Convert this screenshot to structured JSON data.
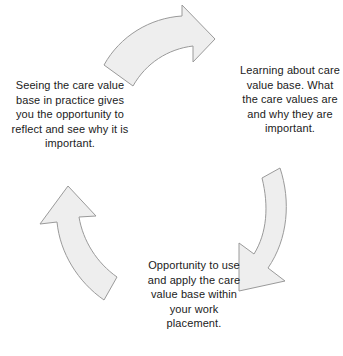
{
  "diagram": {
    "type": "cycle",
    "background_color": "#ffffff",
    "arrow_fill_color": "#eeeeee",
    "arrow_stroke_color": "#9a9a9a",
    "text_color": "#1b1b1b",
    "stages": [
      {
        "id": "learning",
        "position": "right",
        "text": "Learning about care value base. What the care values are and why they are important.",
        "lines": [
          "Learning about",
          "care value base.",
          "What the care",
          "values are and",
          "why they are",
          "important."
        ]
      },
      {
        "id": "apply",
        "position": "bottom",
        "text": "Opportunity to use and apply the care value base within your work placement.",
        "lines": [
          "Opportunity to",
          "use and apply",
          "the care value",
          "base within your",
          "work placement."
        ]
      },
      {
        "id": "reflect",
        "position": "left",
        "text": "Seeing the care value base in practice gives you the opportunity to reflect and see why it is important.",
        "lines": [
          "Seeing the care",
          "value base in",
          "practice gives you",
          "the opportunity to",
          "reflect and see why",
          "it is important."
        ]
      }
    ],
    "arrows": [
      {
        "id": "top-arrow",
        "direction": "clockwise",
        "from": "reflect",
        "to": "learning"
      },
      {
        "id": "right-arrow",
        "direction": "clockwise",
        "from": "learning",
        "to": "apply"
      },
      {
        "id": "bottom-left-arrow",
        "direction": "clockwise",
        "from": "apply",
        "to": "reflect"
      }
    ]
  }
}
